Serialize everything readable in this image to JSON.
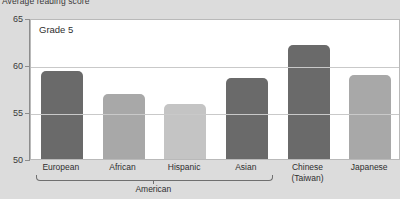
{
  "chart_data": {
    "type": "bar",
    "title": "Average reading score",
    "annotation": "Grade 5",
    "xlabel": "",
    "ylabel": "",
    "ylim": [
      50,
      65
    ],
    "yticks": [
      50,
      55,
      60,
      65
    ],
    "ytick_labels": [
      "50",
      "55",
      "60",
      "65"
    ],
    "grid": true,
    "legend": "none",
    "categories": [
      "European",
      "African",
      "Hispanic",
      "Asian",
      "Chinese\n(Taiwan)",
      "Japanese"
    ],
    "category_lines": [
      [
        "European",
        ""
      ],
      [
        "African",
        ""
      ],
      [
        "Hispanic",
        ""
      ],
      [
        "Asian",
        ""
      ],
      [
        "Chinese",
        "(Taiwan)"
      ],
      [
        "Japanese",
        ""
      ]
    ],
    "values": [
      59.4,
      56.9,
      55.8,
      58.6,
      62.1,
      58.9
    ],
    "bar_colors": [
      "#6a6a6a",
      "#a8a8a8",
      "#c4c4c4",
      "#6a6a6a",
      "#6a6a6a",
      "#a8a8a8"
    ],
    "groups": [
      {
        "label": "American",
        "start_index": 0,
        "end_index": 3
      }
    ]
  },
  "style": {
    "page_background": "#dcdcdc",
    "plot_background": "#ffffff",
    "grid_color": "#c9c9c9",
    "axis_color": "#8d8d8d",
    "text_color": "#2f2f2f",
    "bracket_color": "#6f6f6f"
  }
}
